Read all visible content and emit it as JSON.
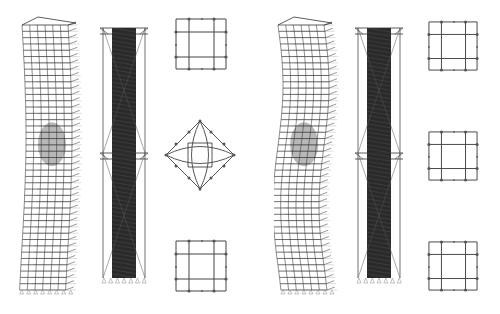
{
  "figure": {
    "colors": {
      "line": "#333333",
      "ghost": "#bbbbbb",
      "node": "#555555",
      "background": "#ffffff"
    },
    "left_group": {
      "tower_model": {
        "label": "twisted tower frame model (left)",
        "floors": 40
      },
      "core_model": {
        "label": "core and outrigger model (left)",
        "floors": 40
      },
      "plans": [
        {
          "label": "upper floor plan",
          "shape": "square grid"
        },
        {
          "label": "middle floor plan",
          "shape": "diamond with curved ribs"
        },
        {
          "label": "lower floor plan",
          "shape": "square grid"
        }
      ]
    },
    "right_group": {
      "tower_model": {
        "label": "twisted tower frame model (right)",
        "floors": 40
      },
      "core_model": {
        "label": "core and outrigger model (right)",
        "floors": 40
      },
      "plans": [
        {
          "label": "upper floor plan",
          "shape": "square grid"
        },
        {
          "label": "middle floor plan",
          "shape": "square grid"
        },
        {
          "label": "lower floor plan",
          "shape": "square grid"
        }
      ]
    }
  }
}
